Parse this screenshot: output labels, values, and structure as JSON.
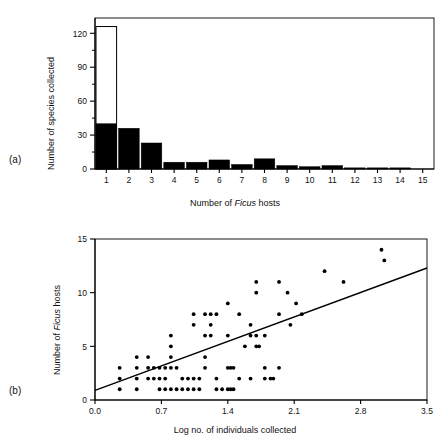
{
  "figure": {
    "panels": [
      {
        "label": "(a)",
        "xlabel_prefix": "Number of ",
        "xlabel_italic": "Ficus",
        "xlabel_suffix": " hosts",
        "ylabel": "Number of species collected"
      },
      {
        "label": "(b)",
        "xlabel": "Log no. of individuals collected",
        "ylabel_prefix": "Number of ",
        "ylabel_italic": "Ficus",
        "ylabel_suffix": " hosts"
      }
    ]
  },
  "chart_data": [
    {
      "type": "bar",
      "panel": "(a)",
      "title": "",
      "xlabel": "Number of Ficus hosts",
      "ylabel": "Number of species collected",
      "categories": [
        "1",
        "2",
        "3",
        "4",
        "5",
        "6",
        "7",
        "8",
        "9",
        "10",
        "11",
        "12",
        "13",
        "14",
        "15"
      ],
      "values": [
        126,
        36,
        23,
        6,
        6,
        8,
        4,
        9,
        3,
        2,
        3,
        1,
        1,
        1,
        0
      ],
      "series": [
        {
          "name": "filled (black) portion",
          "values": [
            40,
            36,
            23,
            6,
            6,
            8,
            4,
            9,
            3,
            2,
            3,
            1,
            1,
            1,
            0
          ]
        },
        {
          "name": "open (white) portion total",
          "values": [
            126,
            36,
            23,
            6,
            6,
            8,
            4,
            9,
            3,
            2,
            3,
            1,
            1,
            1,
            0
          ]
        }
      ],
      "ylim": [
        0,
        130
      ],
      "yticks": [
        0,
        30,
        60,
        90,
        120
      ],
      "yminorticks": [
        15,
        45,
        75,
        105
      ],
      "xtick_labels": [
        "1",
        "2",
        "3",
        "4",
        "5",
        "6",
        "7",
        "8",
        "9",
        "10",
        "11",
        "12",
        "13",
        "14",
        "15"
      ],
      "grid": false,
      "legend": "none",
      "note": "First bar is drawn as an open (unfilled) outline bar reaching 126 with a solid black sub-bar to 40"
    },
    {
      "type": "scatter",
      "panel": "(b)",
      "title": "",
      "xlabel": "Log no. of individuals collected",
      "ylabel": "Number of Ficus hosts",
      "xlim": [
        0.0,
        3.5
      ],
      "ylim": [
        0,
        15
      ],
      "xticks": [
        0.0,
        0.7,
        1.4,
        2.1,
        2.8,
        3.5
      ],
      "xtick_labels": [
        "0.0",
        "0.7",
        "1.4",
        "2.1",
        "2.8",
        "3.5"
      ],
      "yticks": [
        0,
        5,
        10,
        15
      ],
      "ytick_labels": [
        "0",
        "5",
        "10",
        "15"
      ],
      "grid": false,
      "legend": "none",
      "points": [
        [
          0.26,
          3
        ],
        [
          0.26,
          2
        ],
        [
          0.26,
          1
        ],
        [
          0.44,
          4
        ],
        [
          0.44,
          3
        ],
        [
          0.44,
          2
        ],
        [
          0.44,
          1
        ],
        [
          0.56,
          4
        ],
        [
          0.56,
          3
        ],
        [
          0.56,
          2
        ],
        [
          0.62,
          3
        ],
        [
          0.62,
          2
        ],
        [
          0.68,
          3
        ],
        [
          0.68,
          2
        ],
        [
          0.68,
          1
        ],
        [
          0.74,
          3
        ],
        [
          0.74,
          2
        ],
        [
          0.74,
          1
        ],
        [
          0.8,
          6
        ],
        [
          0.8,
          5
        ],
        [
          0.8,
          4
        ],
        [
          0.8,
          3
        ],
        [
          0.8,
          1
        ],
        [
          0.86,
          3
        ],
        [
          0.86,
          1
        ],
        [
          0.92,
          2
        ],
        [
          0.92,
          1
        ],
        [
          0.98,
          2
        ],
        [
          0.98,
          1
        ],
        [
          1.04,
          8
        ],
        [
          1.04,
          7
        ],
        [
          1.04,
          2
        ],
        [
          1.04,
          1
        ],
        [
          1.1,
          2
        ],
        [
          1.1,
          1
        ],
        [
          1.16,
          8
        ],
        [
          1.16,
          6
        ],
        [
          1.16,
          4
        ],
        [
          1.16,
          3
        ],
        [
          1.22,
          8
        ],
        [
          1.22,
          7
        ],
        [
          1.22,
          6
        ],
        [
          1.28,
          8
        ],
        [
          1.28,
          2
        ],
        [
          1.28,
          1
        ],
        [
          1.34,
          1
        ],
        [
          1.4,
          9
        ],
        [
          1.4,
          6
        ],
        [
          1.4,
          3
        ],
        [
          1.4,
          1
        ],
        [
          1.43,
          3
        ],
        [
          1.43,
          1
        ],
        [
          1.46,
          3
        ],
        [
          1.46,
          1
        ],
        [
          1.52,
          8
        ],
        [
          1.52,
          2
        ],
        [
          1.58,
          5
        ],
        [
          1.64,
          7
        ],
        [
          1.64,
          6
        ],
        [
          1.64,
          2
        ],
        [
          1.7,
          11
        ],
        [
          1.7,
          10
        ],
        [
          1.7,
          6
        ],
        [
          1.7,
          5
        ],
        [
          1.73,
          5
        ],
        [
          1.79,
          6
        ],
        [
          1.79,
          3
        ],
        [
          1.79,
          2
        ],
        [
          1.85,
          2
        ],
        [
          1.88,
          2
        ],
        [
          1.94,
          11
        ],
        [
          1.94,
          8
        ],
        [
          1.94,
          3
        ],
        [
          2.03,
          10
        ],
        [
          2.06,
          7
        ],
        [
          2.12,
          9
        ],
        [
          2.18,
          8
        ],
        [
          2.42,
          12
        ],
        [
          2.62,
          11
        ],
        [
          3.02,
          14
        ],
        [
          3.05,
          13
        ]
      ],
      "fit_line": {
        "x": [
          0.0,
          3.5
        ],
        "y": [
          0.9,
          12.3
        ],
        "style": "solid"
      }
    }
  ]
}
